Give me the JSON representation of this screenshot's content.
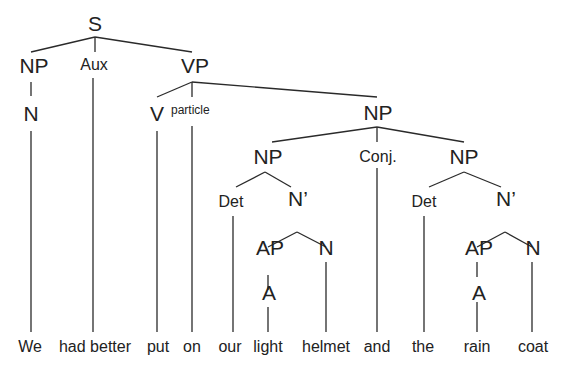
{
  "diagram": {
    "type": "syntax-tree",
    "sentence": "We had better put on our light helmet and the rain coat",
    "nodes": {
      "s": "S",
      "np_subj": "NP",
      "aux": "Aux",
      "vp": "VP",
      "n_subj": "N",
      "v": "V",
      "particle": "particle",
      "np_obj": "NP",
      "np1": "NP",
      "conj": "Conj.",
      "np2": "NP",
      "det1": "Det",
      "nbar1": "N’",
      "ap1": "AP",
      "n1": "N",
      "a1": "A",
      "det2": "Det",
      "nbar2": "N’",
      "ap2": "AP",
      "n2": "N",
      "a2": "A"
    },
    "words": {
      "we": "We",
      "had_better": "had better",
      "put": "put",
      "on": "on",
      "our": "our",
      "light": "light",
      "helmet": "helmet",
      "and": "and",
      "the": "the",
      "rain": "rain",
      "coat": "coat"
    },
    "edges": [
      [
        "s",
        "np_subj"
      ],
      [
        "s",
        "aux"
      ],
      [
        "s",
        "vp"
      ],
      [
        "np_subj",
        "n_subj"
      ],
      [
        "n_subj",
        "we"
      ],
      [
        "aux",
        "had_better"
      ],
      [
        "vp",
        "v"
      ],
      [
        "vp",
        "particle"
      ],
      [
        "vp",
        "np_obj"
      ],
      [
        "v",
        "put"
      ],
      [
        "particle",
        "on"
      ],
      [
        "np_obj",
        "np1"
      ],
      [
        "np_obj",
        "conj"
      ],
      [
        "np_obj",
        "np2"
      ],
      [
        "np1",
        "det1"
      ],
      [
        "np1",
        "nbar1"
      ],
      [
        "det1",
        "our"
      ],
      [
        "nbar1",
        "ap1"
      ],
      [
        "nbar1",
        "n1"
      ],
      [
        "ap1",
        "a1"
      ],
      [
        "a1",
        "light"
      ],
      [
        "n1",
        "helmet"
      ],
      [
        "conj",
        "and"
      ],
      [
        "np2",
        "det2"
      ],
      [
        "np2",
        "nbar2"
      ],
      [
        "det2",
        "the"
      ],
      [
        "nbar2",
        "ap2"
      ],
      [
        "nbar2",
        "n2"
      ],
      [
        "ap2",
        "a2"
      ],
      [
        "a2",
        "rain"
      ],
      [
        "n2",
        "coat"
      ]
    ]
  }
}
